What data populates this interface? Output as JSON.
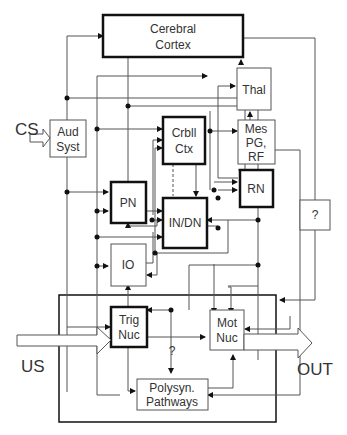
{
  "diagram": {
    "nodes": {
      "cortex": {
        "line1": "Cerebral",
        "line2": "Cortex"
      },
      "thal": {
        "label": "Thal"
      },
      "aud": {
        "line1": "Aud",
        "line2": "Syst"
      },
      "crbll": {
        "line1": "Crbll",
        "line2": "Ctx"
      },
      "mes": {
        "line1": "Mes",
        "line2": "PG,",
        "line3": "RF"
      },
      "pn": {
        "label": "PN"
      },
      "indn": {
        "label": "IN/DN"
      },
      "rn": {
        "label": "RN"
      },
      "unknown": {
        "label": "?"
      },
      "io": {
        "label": "IO"
      },
      "trig": {
        "line1": "Trig",
        "line2": "Nuc"
      },
      "mot": {
        "line1": "Mot",
        "line2": "Nuc"
      },
      "poly": {
        "line1": "Polysyn.",
        "line2": "Pathways"
      },
      "question_mid": {
        "label": "?"
      }
    },
    "inputs": {
      "cs": "CS",
      "us": "US"
    },
    "outputs": {
      "out": "OUT"
    }
  }
}
